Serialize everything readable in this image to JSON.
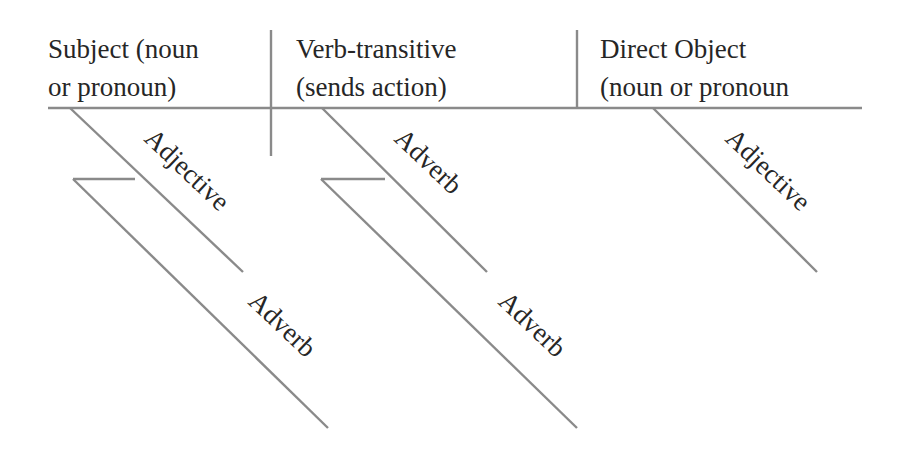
{
  "diagram": {
    "type": "sentence-diagram",
    "line_color": "#8a8a8a",
    "text_color": "#262626",
    "headers": {
      "subject": {
        "line1": "Subject (noun",
        "line2": "or pronoun)"
      },
      "verb": {
        "line1": "Verb-transitive",
        "line2": "(sends action)"
      },
      "direct_object": {
        "line1": "Direct Object",
        "line2": "(noun or pronoun"
      }
    },
    "modifiers": {
      "subject_adjective": "Adjective",
      "subject_adverb": "Adverb",
      "verb_adverb": "Adverb",
      "verb_adverb_modifier": "Adverb",
      "object_adjective": "Adjective"
    }
  }
}
